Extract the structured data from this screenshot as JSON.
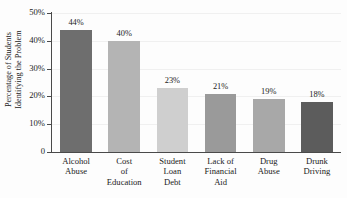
{
  "chart_data": {
    "type": "bar",
    "title": "",
    "subtitle": "",
    "xlabel": "",
    "ylabel": "Percentage of Students Identifying the Problem",
    "ylabel_lines": [
      "Percentage of Students",
      "Identifying the Problem"
    ],
    "categories": [
      "Alcohol Abuse",
      "Cost of Education",
      "Student Loan Debt",
      "Lack of Financial Aid",
      "Drug Abuse",
      "Drunk Driving"
    ],
    "category_lines": [
      [
        "Alcohol",
        "Abuse"
      ],
      [
        "Cost",
        "of",
        "Education"
      ],
      [
        "Student",
        "Loan",
        "Debt"
      ],
      [
        "Lack of",
        "Financial",
        "Aid"
      ],
      [
        "Drug",
        "Abuse"
      ],
      [
        "Drunk",
        "Driving"
      ]
    ],
    "values": [
      44,
      40,
      23,
      21,
      19,
      18
    ],
    "data_labels": [
      "44%",
      "40%",
      "23%",
      "21%",
      "19%",
      "18%"
    ],
    "bar_colors": [
      "#6e6e6e",
      "#b4b4b4",
      "#cfcfcf",
      "#9a9a9a",
      "#a8a8a8",
      "#5c5c5c"
    ],
    "ylim": [
      0,
      50
    ],
    "ytick_values": [
      0,
      10,
      20,
      30,
      40,
      50
    ],
    "ytick_labels": [
      "0",
      "10%",
      "20%",
      "30%",
      "40%",
      "50%"
    ],
    "grid": true,
    "grid_color": "#f0f0f0",
    "legend": null,
    "axis_color": "#4a4a4a",
    "text_color": "#1b1b1b",
    "background": "#fdfdfd"
  }
}
